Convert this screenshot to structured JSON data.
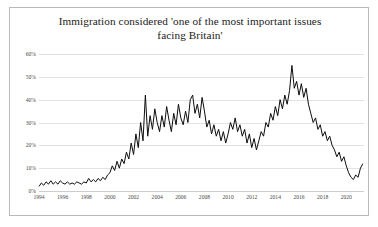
{
  "chart_card": {
    "border_color": "#b9b9b9",
    "background": "#ffffff"
  },
  "chart_data": {
    "type": "line",
    "title": "Immigration considered  'one of the most important issues facing Britain'",
    "title_line_1": "Immigration considered  'one of the most important issues",
    "title_line_2": "facing Britain'",
    "xlabel": "",
    "ylabel": "",
    "xlim": [
      1994,
      2021.5
    ],
    "ylim": [
      0,
      60
    ],
    "grid": true,
    "grid_axis": "y",
    "legend": false,
    "legend_position": "none",
    "line_color": "#0d0d0d",
    "line_width": 1.0,
    "y_ticks": [
      0,
      10,
      20,
      30,
      40,
      50,
      60
    ],
    "y_tick_labels": [
      "0%",
      "10%",
      "20%",
      "30%",
      "40%",
      "50%",
      "60%"
    ],
    "x_ticks": [
      1994,
      1996,
      1998,
      2000,
      2002,
      2004,
      2006,
      2008,
      2010,
      2012,
      2014,
      2016,
      2018,
      2020
    ],
    "x_tick_labels": [
      "1994",
      "1996",
      "1998",
      "2000",
      "2002",
      "2004",
      "2006",
      "2008",
      "2010",
      "2012",
      "2014",
      "2016",
      "2018",
      "2020"
    ],
    "series": [
      {
        "name": "Immigration named one of the most important issues facing Britain",
        "unit": "%",
        "x": [
          1994.0,
          1994.2,
          1994.4,
          1994.6,
          1994.8,
          1995.0,
          1995.2,
          1995.4,
          1995.6,
          1995.8,
          1996.0,
          1996.2,
          1996.4,
          1996.6,
          1996.8,
          1997.0,
          1997.2,
          1997.4,
          1997.6,
          1997.8,
          1998.0,
          1998.2,
          1998.4,
          1998.6,
          1998.8,
          1999.0,
          1999.2,
          1999.4,
          1999.6,
          1999.8,
          2000.0,
          2000.2,
          2000.4,
          2000.6,
          2000.8,
          2001.0,
          2001.2,
          2001.4,
          2001.6,
          2001.8,
          2002.0,
          2002.2,
          2002.4,
          2002.6,
          2002.8,
          2003.0,
          2003.2,
          2003.4,
          2003.6,
          2003.8,
          2004.0,
          2004.2,
          2004.4,
          2004.6,
          2004.8,
          2005.0,
          2005.2,
          2005.4,
          2005.6,
          2005.8,
          2006.0,
          2006.2,
          2006.4,
          2006.6,
          2006.8,
          2007.0,
          2007.2,
          2007.4,
          2007.6,
          2007.8,
          2008.0,
          2008.2,
          2008.4,
          2008.6,
          2008.8,
          2009.0,
          2009.2,
          2009.4,
          2009.6,
          2009.8,
          2010.0,
          2010.2,
          2010.4,
          2010.6,
          2010.8,
          2011.0,
          2011.2,
          2011.4,
          2011.6,
          2011.8,
          2012.0,
          2012.2,
          2012.4,
          2012.6,
          2012.8,
          2013.0,
          2013.2,
          2013.4,
          2013.6,
          2013.8,
          2014.0,
          2014.2,
          2014.4,
          2014.6,
          2014.8,
          2015.0,
          2015.2,
          2015.4,
          2015.6,
          2015.8,
          2016.0,
          2016.2,
          2016.4,
          2016.6,
          2016.8,
          2017.0,
          2017.2,
          2017.4,
          2017.6,
          2017.8,
          2018.0,
          2018.2,
          2018.4,
          2018.6,
          2018.8,
          2019.0,
          2019.2,
          2019.4,
          2019.6,
          2019.8,
          2020.0,
          2020.2,
          2020.4,
          2020.6,
          2020.8,
          2021.0,
          2021.2,
          2021.4
        ],
        "y": [
          2.0,
          3.5,
          2.5,
          4.0,
          3.0,
          4.5,
          3.0,
          4.0,
          3.0,
          4.5,
          3.5,
          3.0,
          4.0,
          3.0,
          3.5,
          3.0,
          4.0,
          3.5,
          3.0,
          4.0,
          3.5,
          5.5,
          4.0,
          5.0,
          4.0,
          5.5,
          4.5,
          6.0,
          5.0,
          7.0,
          8.0,
          11.0,
          9.0,
          13.0,
          10.0,
          14.0,
          12.0,
          17.0,
          14.0,
          21.0,
          16.0,
          25.0,
          19.0,
          30.0,
          22.0,
          42.0,
          24.0,
          33.0,
          27.0,
          36.0,
          30.0,
          26.0,
          33.0,
          28.0,
          37.0,
          31.0,
          26.0,
          34.0,
          29.0,
          38.0,
          32.0,
          29.0,
          35.0,
          30.0,
          40.0,
          42.0,
          34.0,
          38.0,
          32.0,
          41.0,
          35.0,
          28.0,
          31.0,
          25.0,
          29.0,
          24.0,
          27.0,
          22.0,
          26.0,
          21.0,
          25.0,
          30.0,
          27.0,
          32.0,
          26.0,
          29.0,
          24.0,
          27.0,
          21.0,
          25.0,
          19.0,
          23.0,
          18.0,
          22.0,
          26.0,
          24.0,
          30.0,
          28.0,
          34.0,
          31.0,
          37.0,
          33.0,
          40.0,
          36.0,
          42.0,
          38.0,
          44.0,
          55.0,
          45.0,
          48.0,
          42.0,
          47.0,
          41.0,
          45.0,
          38.0,
          34.0,
          30.0,
          32.0,
          27.0,
          29.0,
          24.0,
          26.0,
          22.0,
          24.0,
          20.0,
          18.0,
          15.0,
          17.0,
          13.0,
          15.0,
          11.0,
          8.0,
          6.0,
          5.0,
          7.0,
          6.0,
          10.0,
          12.0
        ]
      }
    ]
  }
}
